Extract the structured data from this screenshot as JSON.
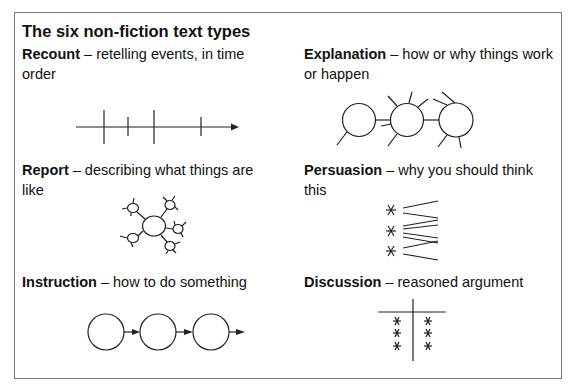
{
  "title": "The six non-fiction text types",
  "text_types": [
    {
      "id": "recount",
      "name": "Recount",
      "separator": " – ",
      "description": "retelling events, in time order",
      "diagram": "timeline"
    },
    {
      "id": "explanation",
      "name": "Explanation",
      "separator": " – ",
      "description": "how or why things work or happen",
      "diagram": "linked-circles-with-spokes"
    },
    {
      "id": "report",
      "name": "Report",
      "separator": " – ",
      "description": "describing what things are like",
      "diagram": "spider-web"
    },
    {
      "id": "persuasion",
      "name": "Persuasion",
      "separator": " – ",
      "description": "why you should think this",
      "diagram": "asterisks-with-fanned-lines"
    },
    {
      "id": "instruction",
      "name": "Instruction",
      "separator": " – ",
      "description": "how to do something",
      "diagram": "circles-with-arrows"
    },
    {
      "id": "discussion",
      "name": "Discussion",
      "separator": " – ",
      "description": "reasoned argument",
      "diagram": "t-chart-with-asterisks"
    }
  ],
  "colors": {
    "border": "#7a7a7a",
    "ink": "#222222",
    "background": "#ffffff"
  }
}
